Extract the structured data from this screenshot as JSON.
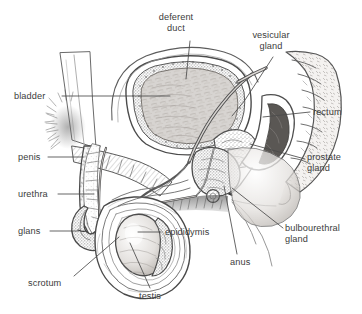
{
  "figure": {
    "style": "pencil-sketch-grayscale",
    "background_color": "#ffffff",
    "ink_color": "#3c3c3c",
    "leader_line_color": "#4a4a4a",
    "width": 362,
    "height": 314
  },
  "labels": [
    {
      "id": "deferent-duct",
      "text": "deferent\nduct",
      "x": 172,
      "y": 12,
      "align": "center"
    },
    {
      "id": "vesicular-gland",
      "text": "vesicular\ngland",
      "x": 268,
      "y": 30,
      "align": "center"
    },
    {
      "id": "bladder",
      "text": "bladder",
      "x": 14,
      "y": 91,
      "align": "left"
    },
    {
      "id": "rectum",
      "text": "rectum",
      "x": 313,
      "y": 108,
      "align": "left"
    },
    {
      "id": "penis",
      "text": "penis",
      "x": 18,
      "y": 153,
      "align": "left"
    },
    {
      "id": "prostate-gland",
      "text": "prostate\ngland",
      "x": 307,
      "y": 153,
      "align": "left"
    },
    {
      "id": "urethra",
      "text": "urethra",
      "x": 18,
      "y": 190,
      "align": "left"
    },
    {
      "id": "glans",
      "text": "glans",
      "x": 18,
      "y": 227,
      "align": "left"
    },
    {
      "id": "epididymis",
      "text": "epididymis",
      "x": 165,
      "y": 228,
      "align": "left"
    },
    {
      "id": "bulbourethral-gland",
      "text": "bulbourethral\ngland",
      "x": 285,
      "y": 224,
      "align": "left"
    },
    {
      "id": "anus",
      "text": "anus",
      "x": 230,
      "y": 258,
      "align": "left"
    },
    {
      "id": "scrotum",
      "text": "scrotum",
      "x": 28,
      "y": 279,
      "align": "left"
    },
    {
      "id": "testis",
      "text": "testis",
      "x": 139,
      "y": 292,
      "align": "left"
    }
  ],
  "leader_lines": [
    {
      "id": "leader-deferent-duct",
      "points": "190,41 186,79"
    },
    {
      "id": "leader-vesicular-gland",
      "points": "273,57 245,100 232,116"
    },
    {
      "id": "leader-bladder",
      "points": "62,96 170,96"
    },
    {
      "id": "leader-rectum",
      "points": "310,112 263,117"
    },
    {
      "id": "leader-penis",
      "points": "48,157 84,157"
    },
    {
      "id": "leader-prostate-gland",
      "points": "305,159 250,144"
    },
    {
      "id": "leader-urethra",
      "points": "58,194 94,194"
    },
    {
      "id": "leader-glans",
      "points": "50,231 78,231"
    },
    {
      "id": "leader-epididymis",
      "points": "161,232 138,232"
    },
    {
      "id": "leader-bulbourethral-gland",
      "points": "283,228 232,188"
    },
    {
      "id": "leader-anus",
      "points": "237,254 224,186"
    },
    {
      "id": "leader-scrotum",
      "points": "74,276 119,237"
    },
    {
      "id": "leader-testis",
      "points": "150,288 130,243"
    }
  ]
}
